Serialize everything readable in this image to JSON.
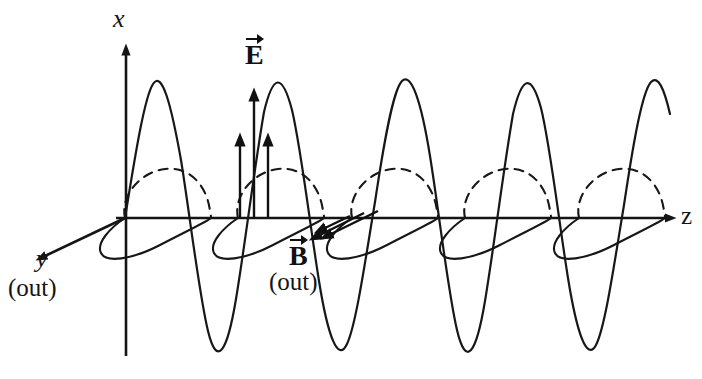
{
  "figure": {
    "width": 702,
    "height": 379,
    "background": "#ffffff",
    "ink": "#151515"
  },
  "axes": {
    "origin": {
      "x": 125,
      "y": 218
    },
    "x_axis": {
      "label": "x",
      "direction": "up",
      "tip": {
        "x": 126,
        "y": 42
      },
      "tail": {
        "x": 126,
        "y": 355
      },
      "arrow": true
    },
    "z_axis": {
      "label": "z",
      "direction": "right",
      "tip": {
        "x": 678,
        "y": 218
      },
      "tail": {
        "x": 118,
        "y": 218
      },
      "arrow": true
    },
    "y_axis": {
      "label": "y",
      "sublabel": "(out)",
      "direction": "down-left (out of page)",
      "tip": {
        "x": 33,
        "y": 262
      },
      "tail": {
        "x": 125,
        "y": 218
      },
      "arrow": true
    }
  },
  "waves": {
    "electric": {
      "name": "E",
      "plane": "x-z",
      "style": "solid",
      "amplitude_px": 137,
      "wavelength_px": 113.5,
      "phase": "sin",
      "start_z_px": 125,
      "end_z_px": 670
    },
    "magnetic": {
      "name": "B",
      "plane": "y-z",
      "style": "dashed upper lobe, solid lower lobe",
      "amplitude_px": 78,
      "wavelength_px": 113.5,
      "phase": "sin",
      "perspective_dx": -62,
      "perspective_dy": 30,
      "start_z_px": 125,
      "end_z_px": 670
    }
  },
  "field_vectors": {
    "electric_label": "E",
    "electric_sublabel": "",
    "magnetic_label": "B",
    "magnetic_sublabel": "(out)",
    "E_arrows": [
      {
        "z": 240,
        "tip_y": 130,
        "base_y": 218
      },
      {
        "z": 254,
        "tip_y": 85,
        "base_y": 218
      },
      {
        "z": 268,
        "tip_y": 130,
        "base_y": 218
      }
    ],
    "B_arrows": [
      {
        "from_z": 375,
        "to_z": 318,
        "tip_dx": -57,
        "tip_dy": 28
      },
      {
        "from_z": 362,
        "to_z": 306,
        "tip_dx": -56,
        "tip_dy": 27
      },
      {
        "from_z": 348,
        "to_z": 313,
        "tip_dx": -35,
        "tip_dy": 17
      }
    ]
  },
  "labels": {
    "x": "x",
    "y": "y",
    "y_out": "(out)",
    "z": "z",
    "E": "E",
    "B": "B",
    "B_out": "(out)"
  }
}
